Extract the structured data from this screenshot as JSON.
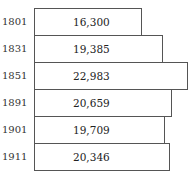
{
  "chart_data": {
    "type": "bar",
    "orientation": "horizontal",
    "title": "",
    "xlabel": "",
    "ylabel": "",
    "categories": [
      "1801",
      "1831",
      "1851",
      "1891",
      "1901",
      "1911"
    ],
    "values": [
      16300,
      19385,
      22983,
      20659,
      19709,
      20346
    ],
    "value_labels": [
      "16,300",
      "19,385",
      "22,983",
      "20,659",
      "19,709",
      "20,346"
    ],
    "grid": false,
    "legend": null
  },
  "rows": [
    {
      "year": "1801",
      "label": "16,300"
    },
    {
      "year": "1831",
      "label": "19,385"
    },
    {
      "year": "1851",
      "label": "22,983"
    },
    {
      "year": "1891",
      "label": "20,659"
    },
    {
      "year": "1901",
      "label": "19,709"
    },
    {
      "year": "1911",
      "label": "20,346"
    }
  ]
}
